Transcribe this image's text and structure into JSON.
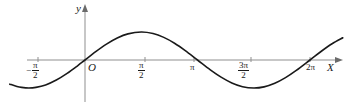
{
  "figure": {
    "type": "math-plot",
    "background_color": "#ffffff",
    "curve_color": "#1a1a1a",
    "axis_color": "#8a8a8a",
    "text_color": "#1a1a1a"
  },
  "axes": {
    "x_axis_name": "X",
    "y_axis_name": "y",
    "origin_label": "O",
    "x_ticks": [
      {
        "label_minus": "−",
        "numerator": "π",
        "denominator": "2",
        "kind": "fraction",
        "value": -1.5708,
        "text": "-π/2"
      },
      {
        "label": "π",
        "numerator": "π",
        "denominator": "2",
        "kind": "fraction",
        "value": 1.5708,
        "text": "π/2"
      },
      {
        "label": "π",
        "kind": "plain",
        "value": 3.1416,
        "text": "π"
      },
      {
        "numerator": "3π",
        "denominator": "2",
        "kind": "fraction",
        "value": 4.7124,
        "text": "3π/2"
      },
      {
        "label": "2π",
        "kind": "plain",
        "value": 6.2832,
        "text": "2π"
      }
    ]
  },
  "chart_data": {
    "type": "line",
    "title": "",
    "subtitle": "",
    "xlabel": "X",
    "ylabel": "y",
    "function": "y = sin(x)",
    "grid": false,
    "legend": null,
    "xlim": [
      -2.1,
      7.2
    ],
    "ylim": [
      -1.35,
      1.35
    ],
    "xtick_labels": [
      "-π/2",
      "π/2",
      "π",
      "3π/2",
      "2π"
    ],
    "xtick_values": [
      -1.5708,
      1.5708,
      3.1416,
      4.7124,
      6.2832
    ],
    "ytick_labels": [],
    "ytick_values": [],
    "series": [
      {
        "name": "sin(x)",
        "color": "#1a1a1a",
        "x": [
          -2.1,
          -1.9,
          -1.7708,
          -1.5708,
          -1.3708,
          -1.1,
          -0.8,
          -0.5,
          -0.2,
          0,
          0.3,
          0.6,
          0.9,
          1.2,
          1.5708,
          1.9,
          2.2,
          2.5,
          2.8,
          3.1416,
          3.5,
          3.8,
          4.1,
          4.4,
          4.7124,
          5.0,
          5.3,
          5.6,
          5.9,
          6.2832,
          6.6,
          6.9,
          7.2
        ],
        "y": [
          -0.863,
          -0.946,
          -0.979,
          -1.0,
          -0.979,
          -0.891,
          -0.717,
          -0.479,
          -0.199,
          0,
          0.296,
          0.565,
          0.783,
          0.932,
          1.0,
          0.946,
          0.808,
          0.599,
          0.335,
          0,
          -0.351,
          -0.612,
          -0.818,
          -0.952,
          -1.0,
          -0.959,
          -0.832,
          -0.631,
          -0.374,
          0,
          0.312,
          0.579,
          0.793
        ]
      }
    ],
    "annotations": []
  }
}
